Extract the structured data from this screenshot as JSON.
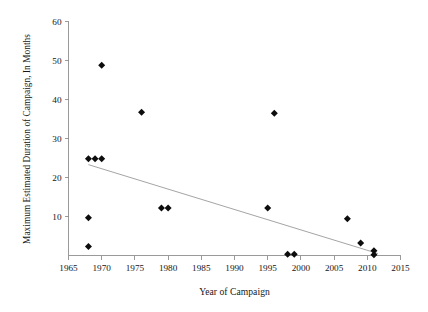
{
  "chart_data": {
    "type": "scatter",
    "title": "",
    "xlabel": "Year of Campaign",
    "ylabel": "Maximum Estimated Duration of Campaign, In Months",
    "xlim": [
      1965,
      2015
    ],
    "ylim": [
      0,
      60
    ],
    "xticks": [
      1965,
      1970,
      1975,
      1980,
      1985,
      1990,
      1995,
      2000,
      2005,
      2010,
      2015
    ],
    "xtick_labels": [
      "1965",
      "1970",
      "1975",
      "1980",
      "1985",
      "1990",
      "1995",
      "2000",
      "2005",
      "2010",
      "2015"
    ],
    "yticks": [
      10,
      20,
      30,
      40,
      50,
      60
    ],
    "ytick_labels": [
      "10",
      "20",
      "30",
      "40",
      "50",
      "60"
    ],
    "grid": false,
    "legend": false,
    "marker": "diamond",
    "marker_color": "#0d0d0d",
    "x": [
      1968,
      1968,
      1968,
      1969,
      1970,
      1970,
      1976,
      1979,
      1980,
      1995,
      1996,
      1998,
      1999,
      2007,
      2009,
      2011,
      2011
    ],
    "y": [
      24.8,
      9.7,
      2.3,
      24.8,
      24.8,
      48.8,
      36.7,
      12.2,
      12.2,
      12.2,
      36.5,
      0.3,
      0.3,
      9.4,
      3.2,
      1.2,
      0.2
    ],
    "points": [
      {
        "x": 1968,
        "y": 24.8
      },
      {
        "x": 1968,
        "y": 9.7
      },
      {
        "x": 1968,
        "y": 2.3
      },
      {
        "x": 1969,
        "y": 24.8
      },
      {
        "x": 1970,
        "y": 24.8
      },
      {
        "x": 1970,
        "y": 48.8
      },
      {
        "x": 1976,
        "y": 36.7
      },
      {
        "x": 1979,
        "y": 12.2
      },
      {
        "x": 1980,
        "y": 12.2
      },
      {
        "x": 1995,
        "y": 12.2
      },
      {
        "x": 1996,
        "y": 36.5
      },
      {
        "x": 1998,
        "y": 0.3
      },
      {
        "x": 1999,
        "y": 0.3
      },
      {
        "x": 2007,
        "y": 9.4
      },
      {
        "x": 2009,
        "y": 3.2
      },
      {
        "x": 2011,
        "y": 1.2
      },
      {
        "x": 2011,
        "y": 0.2
      }
    ],
    "trendline": {
      "type": "linear",
      "color": "#9a9a9a",
      "x_start": 1968.0,
      "y_start": 23.3,
      "x_end": 2011.6,
      "y_end": 0.5
    }
  }
}
